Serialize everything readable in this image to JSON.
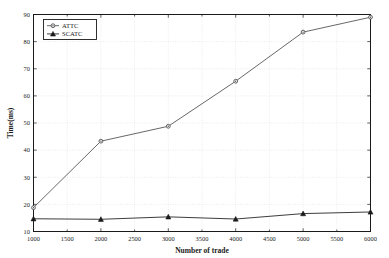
{
  "chart_data": {
    "type": "line",
    "title": "",
    "xlabel": "Number of trade",
    "ylabel": "Time(ms)",
    "xlim": [
      1000,
      6000
    ],
    "ylim": [
      10,
      90
    ],
    "xticks": [
      1000,
      1500,
      2000,
      2500,
      3000,
      3500,
      4000,
      4500,
      5000,
      5500,
      6000
    ],
    "yticks": [
      10,
      20,
      30,
      40,
      50,
      60,
      70,
      80,
      90
    ],
    "grid": true,
    "legend_position": "top-left",
    "x": [
      1000,
      2000,
      3000,
      4000,
      5000,
      6000
    ],
    "series": [
      {
        "name": "ATTC",
        "values": [
          18.8,
          43.3,
          48.8,
          65.4,
          83.5,
          89.0
        ],
        "color": "#4d4d4d",
        "marker": "circle"
      },
      {
        "name": "SCATC",
        "values": [
          14.7,
          14.5,
          15.4,
          14.6,
          16.6,
          17.2
        ],
        "color": "#1a1a1a",
        "marker": "triangle"
      }
    ]
  },
  "axes": {
    "xlabel": "Number of trade",
    "ylabel": "Time(ms)",
    "xtick_labels": [
      "1000",
      "1500",
      "2000",
      "2500",
      "3000",
      "3500",
      "4000",
      "4500",
      "5000",
      "5500",
      "6000"
    ],
    "ytick_labels": [
      "10",
      "20",
      "30",
      "40",
      "50",
      "60",
      "70",
      "80",
      "90"
    ]
  },
  "legend": {
    "items": [
      {
        "label": "ATTC"
      },
      {
        "label": "SCATC"
      }
    ]
  },
  "style": {
    "axis_color": "#1a1a1a",
    "grid_color": "#d9d9d9",
    "background": "#ffffff"
  }
}
